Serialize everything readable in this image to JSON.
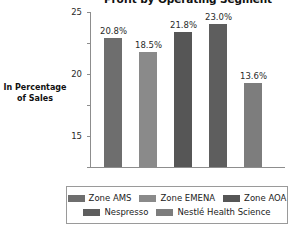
{
  "chart_data": {
    "type": "bar",
    "title": "Profit by Operating Segment",
    "xlabel": "",
    "ylabel": "In Percentage of Sales",
    "ylim": [
      0,
      25
    ],
    "yticks": [
      "0",
      "5",
      "10",
      "15",
      "20",
      "25"
    ],
    "grid": false,
    "legend_position": "bottom",
    "categories": [
      "Zone AMS",
      "Zone EMENA",
      "Zone AOA",
      "Nespresso",
      "Nestlé Health Science"
    ],
    "values": [
      20.8,
      18.5,
      21.8,
      23.0,
      13.6
    ],
    "data_labels": [
      "20.8%",
      "18.5%",
      "21.8%",
      "23.0%",
      "13.6%"
    ],
    "colors": [
      "#6e6e6e",
      "#8a8a8a",
      "#565656",
      "#5e5e5e",
      "#7d7d7d"
    ]
  },
  "axis_label": {
    "line1": "In Percentage",
    "line2": "of Sales"
  },
  "legend": {
    "rows": [
      [
        {
          "label": "Zone AMS",
          "color": "#6e6e6e"
        },
        {
          "label": "Zone EMENA",
          "color": "#8a8a8a"
        },
        {
          "label": "Zone AOA",
          "color": "#565656"
        }
      ],
      [
        {
          "label": "Nespresso",
          "color": "#5e5e5e"
        },
        {
          "label": "Nestlé Health Science",
          "color": "#7d7d7d"
        }
      ]
    ]
  }
}
